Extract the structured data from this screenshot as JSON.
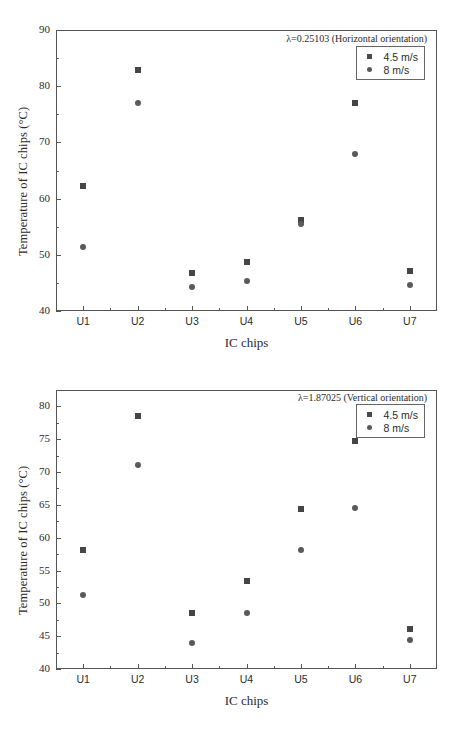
{
  "figure": {
    "panels": [
      {
        "id": "top",
        "annotation": "λ=0.25103 (Horizontal orientation)",
        "xlabel": "IC chips",
        "ylabel": "Temperature of IC chips (°C)",
        "ytick_labels": [
          "90",
          "80",
          "70",
          "60",
          "50",
          "40"
        ],
        "xtick_labels": [
          "U1",
          "U2",
          "U3",
          "U4",
          "U5",
          "U6",
          "U7"
        ],
        "legend": [
          {
            "label": "4.5 m/s",
            "marker": "square"
          },
          {
            "label": "8 m/s",
            "marker": "circle"
          }
        ]
      },
      {
        "id": "bottom",
        "annotation": "λ=1.87025 (Vertical orientation)",
        "xlabel": "IC chips",
        "ylabel": "Temperature of IC chips (°C)",
        "ytick_labels": [
          "80",
          "75",
          "70",
          "65",
          "60",
          "55",
          "50",
          "45",
          "40"
        ],
        "xtick_labels": [
          "U1",
          "U2",
          "U3",
          "U4",
          "U5",
          "U6",
          "U7"
        ],
        "legend": [
          {
            "label": "4.5 m/s",
            "marker": "square"
          },
          {
            "label": "8 m/s",
            "marker": "circle"
          }
        ]
      }
    ],
    "colors": {
      "marker_square": "#454545",
      "marker_circle": "#5a5a5a",
      "axis": "#555555",
      "text": "#2b2b2b",
      "background": "#ffffff"
    }
  },
  "chart_data": [
    {
      "type": "scatter",
      "title": "λ=0.25103 (Horizontal orientation)",
      "xlabel": "IC chips",
      "ylabel": "Temperature of IC chips (°C)",
      "categories": [
        "U1",
        "U2",
        "U3",
        "U4",
        "U5",
        "U6",
        "U7"
      ],
      "ylim": [
        40,
        90
      ],
      "yticks": [
        40,
        50,
        60,
        70,
        80,
        90
      ],
      "ytick_minor_step": 5,
      "grid": false,
      "legend_position": "top-right",
      "series": [
        {
          "name": "4.5 m/s",
          "marker": "square",
          "values": [
            62.2,
            82.8,
            46.7,
            48.8,
            56.2,
            77.0,
            47.1
          ]
        },
        {
          "name": "8 m/s",
          "marker": "circle",
          "values": [
            51.4,
            77.0,
            44.2,
            45.3,
            55.5,
            67.9,
            44.6
          ]
        }
      ]
    },
    {
      "type": "scatter",
      "title": "λ=1.87025 (Vertical orientation)",
      "xlabel": "IC chips",
      "ylabel": "Temperature of IC chips (°C)",
      "categories": [
        "U1",
        "U2",
        "U3",
        "U4",
        "U5",
        "U6",
        "U7"
      ],
      "ylim": [
        40,
        82.5
      ],
      "yticks": [
        40,
        45,
        50,
        55,
        60,
        65,
        70,
        75,
        80
      ],
      "ytick_minor_step": 2.5,
      "grid": false,
      "legend_position": "top-right",
      "series": [
        {
          "name": "4.5 m/s",
          "marker": "square",
          "values": [
            58.1,
            78.6,
            48.6,
            53.4,
            64.3,
            74.8,
            46.1
          ]
        },
        {
          "name": "8 m/s",
          "marker": "circle",
          "values": [
            51.3,
            71.1,
            44.0,
            48.5,
            58.1,
            64.6,
            44.4
          ]
        }
      ]
    }
  ]
}
